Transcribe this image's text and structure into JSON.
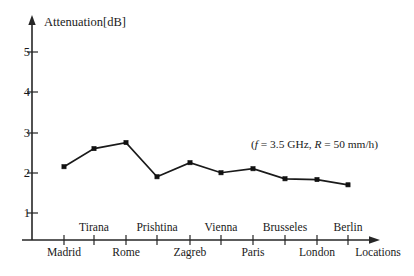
{
  "chart_data": {
    "type": "line",
    "title": "",
    "xlabel": "Locations",
    "ylabel": "Attenuation[dB]",
    "categories": [
      "Madrid",
      "Tirana",
      "Rome",
      "Prishtina",
      "Zagreb",
      "Vienna",
      "Paris",
      "Brusseles",
      "London",
      "Berlin"
    ],
    "values": [
      2.15,
      2.6,
      2.75,
      1.9,
      2.25,
      2.0,
      2.1,
      1.85,
      1.83,
      1.7
    ],
    "series": [
      {
        "name": "Attenuation",
        "values": [
          2.15,
          2.6,
          2.75,
          1.9,
          2.25,
          2.0,
          2.1,
          1.85,
          1.83,
          1.7
        ]
      }
    ],
    "ylim": [
      0,
      5.6
    ],
    "yticks": [
      1,
      2,
      3,
      4,
      5
    ],
    "ytick_labels": [
      "1",
      "2",
      "3",
      "4",
      "5"
    ],
    "xlim": [
      0,
      11
    ],
    "grid": false,
    "legend": false,
    "markers": "filled-square",
    "line_color": "#1a1a1a",
    "annotations": [
      {
        "text": "(f = 3.5 GHz, R = 50 mm/h)",
        "parts": [
          "(",
          "f",
          " = 3.5 GHz, ",
          "R",
          " = 50 mm/h)"
        ]
      }
    ]
  },
  "axes": {
    "y_axis_title": "Attenuation[dB]",
    "x_axis_title": "Locations",
    "y_tick_labels": [
      "5",
      "4",
      "3",
      "2",
      "1"
    ],
    "x_labels_upper": [
      "Tirana",
      "Prishtina",
      "Vienna",
      "Brusseles",
      "Berlin"
    ],
    "x_labels_lower": [
      "Madrid",
      "Rome",
      "Zagreb",
      "Paris",
      "London"
    ]
  },
  "annotation": {
    "open_paren": "(",
    "f_symbol": "f",
    "freq_text": " = 3.5 GHz, ",
    "r_symbol": "R",
    "rain_text": " = 50 mm/h)"
  }
}
